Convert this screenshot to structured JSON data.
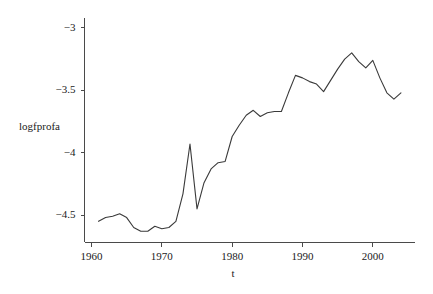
{
  "chart_data": {
    "type": "line",
    "title": "",
    "subtitle": "",
    "xlabel": "t",
    "ylabel": "logfprofa",
    "grid": false,
    "legend": "none",
    "xlim": [
      1959.0,
      2006.0
    ],
    "ylim": [
      -4.72,
      -2.92
    ],
    "xticks": [
      1960,
      1970,
      1980,
      1990,
      2000
    ],
    "xtick_labels": [
      "1960",
      "1970",
      "1980",
      "1990",
      "2000"
    ],
    "yticks": [
      -3,
      -3.5,
      -4,
      -4.5
    ],
    "ytick_labels": [
      "−3",
      "−3.5",
      "−4",
      "−4.5"
    ],
    "series": [
      {
        "name": "logfprofa",
        "color": "#3a3a3a",
        "x": [
          1961,
          1962,
          1963,
          1964,
          1965,
          1966,
          1967,
          1968,
          1969,
          1970,
          1971,
          1972,
          1973,
          1974,
          1975,
          1976,
          1977,
          1978,
          1979,
          1980,
          1981,
          1982,
          1983,
          1984,
          1985,
          1986,
          1987,
          1988,
          1989,
          1990,
          1991,
          1992,
          1993,
          1994,
          1995,
          1996,
          1997,
          1998,
          1999,
          2000,
          2001,
          2002,
          2003,
          2004
        ],
        "values": [
          -4.55,
          -4.52,
          -4.51,
          -4.49,
          -4.52,
          -4.6,
          -4.63,
          -4.63,
          -4.59,
          -4.61,
          -4.6,
          -4.55,
          -4.33,
          -3.93,
          -4.45,
          -4.24,
          -4.13,
          -4.08,
          -4.07,
          -3.87,
          -3.78,
          -3.7,
          -3.66,
          -3.71,
          -3.68,
          -3.67,
          -3.67,
          -3.52,
          -3.38,
          -3.4,
          -3.43,
          -3.45,
          -3.51,
          -3.42,
          -3.33,
          -3.25,
          -3.2,
          -3.27,
          -3.32,
          -3.26,
          -3.4,
          -3.52,
          -3.57,
          -3.52
        ]
      }
    ]
  },
  "plot": {
    "y_axis_label": "logfprofa",
    "x_axis_label": "t"
  }
}
